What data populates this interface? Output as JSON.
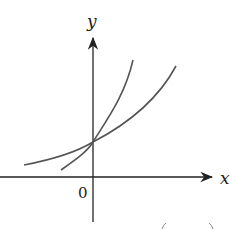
{
  "diagram": {
    "type": "graph-of-exponential-functions",
    "axes": {
      "x_label": "x",
      "y_label": "y",
      "origin_label": "0"
    },
    "curves": [
      {
        "name": "steep-exponential-curve",
        "description": "steeper increasing exponential through (0, y-intercept)"
      },
      {
        "name": "shallow-exponential-curve",
        "description": "flatter increasing exponential through same y-intercept"
      }
    ],
    "shared_point": "y-intercept on positive y-axis",
    "colors": {
      "axes": "#222222",
      "curves": "#555555"
    }
  }
}
